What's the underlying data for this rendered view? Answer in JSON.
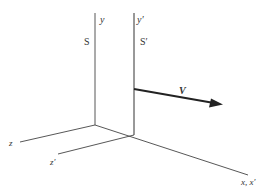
{
  "diagram": {
    "frames": [
      {
        "name": "S",
        "y_axis_label": "y",
        "z_axis_label": "z"
      },
      {
        "name": "S′",
        "y_axis_label": "y′",
        "z_axis_label": "z′"
      }
    ],
    "shared_x_axis_label": "x, x′",
    "velocity_label": "V",
    "colors": {
      "line": "#333333",
      "arrow": "#222222",
      "background": "#ffffff"
    }
  }
}
